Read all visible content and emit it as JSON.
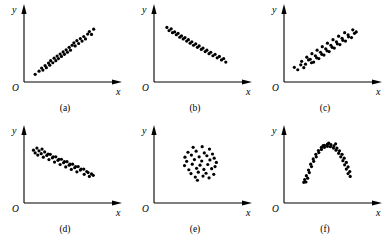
{
  "figure": {
    "background_color": "#ffffff",
    "ink_color": "#000000",
    "width": 390,
    "height": 243,
    "rows": 2,
    "columns": 3,
    "dot_radius": 1.6,
    "axis_stroke_width": 1.1,
    "origin_label": "O",
    "x_axis_label": "x",
    "y_axis_label": "y"
  },
  "chart_data": [
    {
      "type": "scatter",
      "panel": "a",
      "caption": "(a)",
      "title": "",
      "xlabel": "x",
      "ylabel": "y",
      "origin_label": "O",
      "relationship": "strong positive linear correlation",
      "xlim": [
        0,
        10
      ],
      "ylim": [
        0,
        10
      ],
      "grid": false,
      "legend": "none",
      "x": [
        1.3,
        1.75,
        2.05,
        2.2,
        2.45,
        2.6,
        2.85,
        3.0,
        3.1,
        3.35,
        3.5,
        3.7,
        3.85,
        4.0,
        4.2,
        4.35,
        4.55,
        4.7,
        4.9,
        5.05,
        5.25,
        5.4,
        5.6,
        5.8,
        5.95,
        6.15,
        6.35,
        6.55,
        6.75,
        6.95,
        7.15,
        7.4,
        7.6,
        7.85,
        8.1
      ],
      "y": [
        1.1,
        1.55,
        2.0,
        1.7,
        2.35,
        2.05,
        2.7,
        2.4,
        3.05,
        2.75,
        3.4,
        3.05,
        3.7,
        3.35,
        4.0,
        3.65,
        4.3,
        3.95,
        4.6,
        4.25,
        4.95,
        4.55,
        5.25,
        5.6,
        5.15,
        5.9,
        5.5,
        6.2,
        5.85,
        6.5,
        6.15,
        6.85,
        7.2,
        6.8,
        7.55
      ]
    },
    {
      "type": "scatter",
      "panel": "b",
      "caption": "(b)",
      "title": "",
      "xlabel": "x",
      "ylabel": "y",
      "origin_label": "O",
      "relationship": "strong negative linear correlation",
      "xlim": [
        0,
        10
      ],
      "ylim": [
        0,
        10
      ],
      "grid": false,
      "legend": "none",
      "x": [
        1.5,
        1.75,
        2.0,
        2.15,
        2.4,
        2.6,
        2.8,
        3.0,
        3.2,
        3.4,
        3.6,
        3.8,
        4.0,
        4.2,
        4.4,
        4.6,
        4.85,
        5.05,
        5.25,
        5.5,
        5.7,
        5.95,
        6.15,
        6.4,
        6.6,
        6.85,
        7.1,
        7.35,
        7.6,
        7.85,
        8.1,
        8.35
      ],
      "y": [
        7.8,
        7.35,
        7.6,
        7.05,
        7.15,
        6.75,
        6.95,
        6.4,
        6.6,
        6.15,
        6.35,
        5.85,
        6.05,
        5.55,
        5.75,
        5.25,
        5.45,
        4.95,
        5.15,
        4.65,
        4.85,
        4.35,
        4.55,
        4.05,
        4.25,
        3.75,
        3.95,
        3.45,
        3.65,
        3.15,
        3.35,
        2.85
      ]
    },
    {
      "type": "scatter",
      "panel": "c",
      "caption": "(c)",
      "title": "",
      "xlabel": "x",
      "ylabel": "y",
      "origin_label": "O",
      "relationship": "moderate positive correlation, wider spread",
      "xlim": [
        0,
        10
      ],
      "ylim": [
        0,
        10
      ],
      "grid": false,
      "legend": "none",
      "x": [
        1.2,
        1.6,
        1.95,
        2.3,
        2.05,
        2.5,
        2.85,
        3.2,
        2.65,
        3.05,
        3.45,
        3.8,
        3.25,
        3.65,
        4.05,
        4.4,
        3.85,
        4.25,
        4.65,
        5.0,
        4.45,
        4.85,
        5.25,
        5.6,
        5.05,
        5.45,
        5.85,
        6.2,
        5.7,
        6.1,
        6.5,
        6.85,
        6.35,
        6.75,
        7.15,
        7.5,
        7.05,
        7.45,
        7.85,
        8.2,
        8.0,
        8.4
      ],
      "y": [
        2.1,
        1.75,
        2.45,
        2.05,
        2.95,
        2.55,
        3.15,
        2.75,
        3.55,
        3.25,
        2.85,
        3.45,
        4.05,
        3.75,
        3.35,
        3.95,
        4.55,
        4.25,
        3.85,
        4.45,
        5.05,
        4.75,
        4.35,
        4.95,
        5.55,
        5.25,
        4.85,
        5.45,
        6.05,
        5.75,
        5.35,
        5.95,
        6.55,
        6.25,
        5.85,
        6.45,
        7.05,
        6.75,
        6.35,
        6.95,
        7.45,
        7.15
      ]
    },
    {
      "type": "scatter",
      "panel": "d",
      "caption": "(d)",
      "title": "",
      "xlabel": "x",
      "ylabel": "y",
      "origin_label": "O",
      "relationship": "moderate negative correlation, wider spread",
      "xlim": [
        0,
        10
      ],
      "ylim": [
        0,
        10
      ],
      "grid": false,
      "legend": "none",
      "x": [
        1.1,
        1.5,
        1.3,
        1.75,
        2.1,
        1.6,
        2.0,
        2.4,
        2.8,
        2.25,
        2.65,
        3.05,
        3.4,
        2.9,
        3.3,
        3.7,
        4.05,
        3.55,
        3.95,
        4.35,
        4.7,
        4.2,
        4.6,
        5.0,
        5.35,
        4.85,
        5.25,
        5.65,
        6.0,
        5.5,
        5.9,
        6.3,
        6.65,
        6.15,
        6.55,
        6.95,
        7.3,
        7.0,
        7.45,
        7.85,
        7.6,
        8.05
      ],
      "y": [
        7.55,
        7.85,
        7.15,
        7.45,
        7.7,
        6.85,
        7.05,
        7.3,
        7.0,
        6.55,
        6.8,
        6.95,
        6.6,
        6.2,
        6.45,
        6.6,
        6.25,
        5.85,
        6.1,
        6.25,
        5.9,
        5.5,
        5.75,
        5.9,
        5.55,
        5.15,
        5.4,
        5.55,
        5.2,
        4.8,
        5.05,
        5.2,
        4.85,
        4.45,
        4.7,
        4.85,
        4.5,
        4.1,
        4.35,
        4.15,
        3.8,
        3.95
      ]
    },
    {
      "type": "scatter",
      "panel": "e",
      "caption": "(e)",
      "title": "",
      "xlabel": "x",
      "ylabel": "y",
      "origin_label": "O",
      "relationship": "no correlation, random blob",
      "xlim": [
        0,
        10
      ],
      "ylim": [
        0,
        10
      ],
      "grid": false,
      "legend": "none",
      "x": [
        4.55,
        5.6,
        6.45,
        3.95,
        4.9,
        5.85,
        6.8,
        3.6,
        4.35,
        5.25,
        6.15,
        7.0,
        3.8,
        4.7,
        5.55,
        6.5,
        7.25,
        3.55,
        4.45,
        5.35,
        6.25,
        7.1,
        4.05,
        4.95,
        5.8,
        6.7,
        4.3,
        5.15,
        6.05,
        6.95,
        4.8,
        5.7,
        6.4,
        5.05
      ],
      "y": [
        7.95,
        8.05,
        7.7,
        7.25,
        7.4,
        7.15,
        7.0,
        6.55,
        6.85,
        6.6,
        6.75,
        6.4,
        5.95,
        6.2,
        6.0,
        6.15,
        5.8,
        5.35,
        5.55,
        5.4,
        5.5,
        5.2,
        4.75,
        4.95,
        4.8,
        4.9,
        4.2,
        4.4,
        4.25,
        4.1,
        3.7,
        3.85,
        3.6,
        3.25
      ]
    },
    {
      "type": "scatter",
      "panel": "f",
      "caption": "(f)",
      "title": "",
      "xlabel": "x",
      "ylabel": "y",
      "origin_label": "O",
      "relationship": "nonlinear inverted-U (parabolic) relationship",
      "xlim": [
        0,
        10
      ],
      "ylim": [
        0,
        10
      ],
      "grid": false,
      "legend": "none",
      "x": [
        2.55,
        2.4,
        2.75,
        2.6,
        2.95,
        2.85,
        3.2,
        3.1,
        3.45,
        3.4,
        3.75,
        3.7,
        4.05,
        4.0,
        4.35,
        4.35,
        4.7,
        4.7,
        5.05,
        5.05,
        5.4,
        5.45,
        5.75,
        5.8,
        6.05,
        6.15,
        6.35,
        6.45,
        6.6,
        6.75,
        6.85,
        7.0,
        7.05,
        7.25,
        7.25,
        7.45,
        7.45,
        7.65,
        2.3,
        7.7,
        5.2,
        4.55,
        6.0
      ],
      "y": [
        3.0,
        3.35,
        3.55,
        3.9,
        4.35,
        4.7,
        5.2,
        5.55,
        5.95,
        6.3,
        6.6,
        6.95,
        7.2,
        7.5,
        7.65,
        7.95,
        7.95,
        8.25,
        8.1,
        8.4,
        8.05,
        8.35,
        7.85,
        8.15,
        7.55,
        7.85,
        7.1,
        7.45,
        6.6,
        6.95,
        6.05,
        6.4,
        5.45,
        5.8,
        4.85,
        5.15,
        4.2,
        4.5,
        2.95,
        3.8,
        8.55,
        8.2,
        8.45
      ]
    }
  ]
}
